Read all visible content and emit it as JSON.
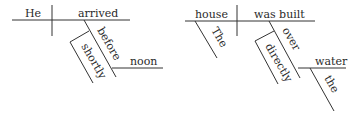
{
  "diagrams": [
    {
      "sentence": "He arrived shortly before noon",
      "subject": "He",
      "verb": "arrived",
      "preposition": "before",
      "adverb_modifier": "shortly",
      "object": "noon"
    },
    {
      "sentence": "The house was built directly over the water",
      "subject": "house",
      "subject_modifier": "The",
      "verb": "was built",
      "preposition": "over",
      "adverb_modifier": "directly",
      "object": "water",
      "object_modifier": "the"
    }
  ]
}
